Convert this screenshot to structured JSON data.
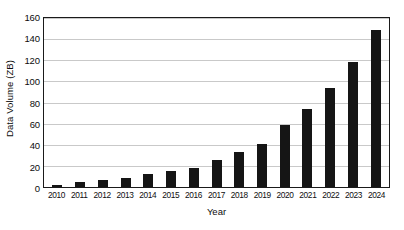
{
  "chart_data": {
    "type": "bar",
    "title": "",
    "subtitle": "",
    "xlabel": "Year",
    "ylabel": "Data Volume (ZB)",
    "categories": [
      "2010",
      "2011",
      "2012",
      "2013",
      "2014",
      "2015",
      "2016",
      "2017",
      "2018",
      "2019",
      "2020",
      "2021",
      "2022",
      "2023",
      "2024"
    ],
    "values": [
      2,
      5,
      6.5,
      9,
      12,
      15.5,
      18,
      26,
      33,
      41,
      59,
      74,
      94,
      118,
      149
    ],
    "series": [
      {
        "name": "Data Volume",
        "values": [
          2,
          5,
          6.5,
          9,
          12,
          15.5,
          18,
          26,
          33,
          41,
          59,
          74,
          94,
          118,
          149
        ]
      }
    ],
    "ylim": [
      0,
      160
    ],
    "yticks": [
      0,
      20,
      40,
      60,
      80,
      100,
      120,
      140,
      160
    ],
    "ytick_labels": [
      "0",
      "20",
      "40",
      "60",
      "80",
      "100",
      "120",
      "140",
      "160"
    ],
    "grid": "horizontal",
    "legend": "none",
    "bar_color": "#151515",
    "gridline_color": "#c9c9c9",
    "axis_color": "#1a1a1a",
    "background_color": "#ffffff"
  }
}
